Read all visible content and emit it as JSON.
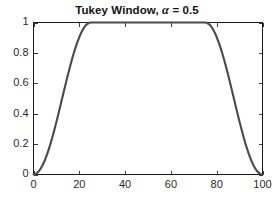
{
  "chart_data": {
    "type": "line",
    "title": "Tukey Window, α = 0.5",
    "title_prefix": "Tukey Window, ",
    "title_symbol": "α",
    "title_suffix": " = 0.5",
    "xlabel": "",
    "ylabel": "",
    "xlim": [
      0,
      100
    ],
    "ylim": [
      0,
      1
    ],
    "grid": false,
    "legend": null,
    "legend_position": "none",
    "line_color": "#4a4a4a",
    "axis_color": "#1a1a1a",
    "background_color": "#ffffff",
    "alpha": 0.5,
    "window_length": 101,
    "taper_start": 25,
    "taper_end": 75,
    "xticks": [
      0,
      20,
      40,
      60,
      80,
      100
    ],
    "xticklabels": [
      "0",
      "20",
      "40",
      "60",
      "80",
      "100"
    ],
    "yticks": [
      0,
      0.2,
      0.4,
      0.6,
      0.8,
      1
    ],
    "yticklabels": [
      "0",
      "0.2",
      "0.4",
      "0.6",
      "0.8",
      "1"
    ],
    "series": [
      {
        "name": "Tukey window",
        "x": [
          0,
          1,
          2,
          3,
          4,
          5,
          6,
          7,
          8,
          9,
          10,
          11,
          12,
          13,
          14,
          15,
          16,
          17,
          18,
          19,
          20,
          21,
          22,
          23,
          24,
          25,
          30,
          35,
          40,
          45,
          50,
          55,
          60,
          65,
          70,
          75,
          76,
          77,
          78,
          79,
          80,
          81,
          82,
          83,
          84,
          85,
          86,
          87,
          88,
          89,
          90,
          91,
          92,
          93,
          94,
          95,
          96,
          97,
          98,
          99,
          100
        ],
        "y": [
          0,
          0.00395,
          0.01571,
          0.03511,
          0.06184,
          0.09549,
          0.13552,
          0.18129,
          0.23209,
          0.28711,
          0.34549,
          0.40631,
          0.4686,
          0.5314,
          0.59369,
          0.65451,
          0.71289,
          0.76791,
          0.81871,
          0.86448,
          0.90451,
          0.93816,
          0.96489,
          0.98429,
          0.99605,
          1,
          1,
          1,
          1,
          1,
          1,
          1,
          1,
          1,
          1,
          1,
          0.99605,
          0.98429,
          0.96489,
          0.93816,
          0.90451,
          0.86448,
          0.81871,
          0.76791,
          0.71289,
          0.65451,
          0.59369,
          0.5314,
          0.4686,
          0.40631,
          0.34549,
          0.28711,
          0.23209,
          0.18129,
          0.13552,
          0.09549,
          0.06184,
          0.03511,
          0.01571,
          0.00395,
          0
        ]
      }
    ]
  }
}
